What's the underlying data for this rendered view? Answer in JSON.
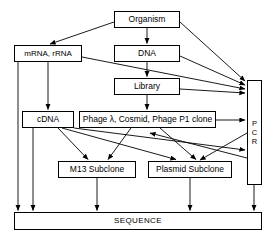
{
  "diagram": {
    "type": "flow-diagram",
    "stroke_color": "#000000",
    "background_color": "#ffffff",
    "nodes": [
      {
        "id": "organism",
        "label": "Organism"
      },
      {
        "id": "mrna",
        "label": "mRNA, rRNA"
      },
      {
        "id": "dna",
        "label": "DNA"
      },
      {
        "id": "library",
        "label": "Library"
      },
      {
        "id": "cdna",
        "label": "cDNA"
      },
      {
        "id": "phage",
        "label": "Phage λ, Cosmid, Phage P1 clone"
      },
      {
        "id": "m13",
        "label": "M13 Subclone"
      },
      {
        "id": "plasmid",
        "label": "Plasmid Subclone"
      },
      {
        "id": "sequence",
        "label": "SEQUENCE"
      },
      {
        "id": "pcr",
        "label": "PCR",
        "letters": [
          "P",
          "C",
          "R"
        ],
        "orientation": "vertical"
      }
    ],
    "edges": [
      {
        "from": "organism",
        "to": "mrna"
      },
      {
        "from": "organism",
        "to": "dna"
      },
      {
        "from": "organism",
        "to": "pcr"
      },
      {
        "from": "mrna",
        "to": "cdna"
      },
      {
        "from": "mrna",
        "to": "sequence"
      },
      {
        "from": "mrna",
        "to": "pcr"
      },
      {
        "from": "dna",
        "to": "library"
      },
      {
        "from": "dna",
        "to": "pcr"
      },
      {
        "from": "library",
        "to": "phage"
      },
      {
        "from": "library",
        "to": "pcr"
      },
      {
        "from": "cdna",
        "to": "m13"
      },
      {
        "from": "cdna",
        "to": "plasmid"
      },
      {
        "from": "cdna",
        "to": "pcr"
      },
      {
        "from": "cdna",
        "to": "sequence"
      },
      {
        "from": "phage",
        "to": "m13"
      },
      {
        "from": "phage",
        "to": "plasmid"
      },
      {
        "from": "phage",
        "to": "pcr"
      },
      {
        "from": "m13",
        "to": "sequence"
      },
      {
        "from": "plasmid",
        "to": "sequence"
      },
      {
        "from": "pcr",
        "to": "sequence"
      }
    ]
  }
}
